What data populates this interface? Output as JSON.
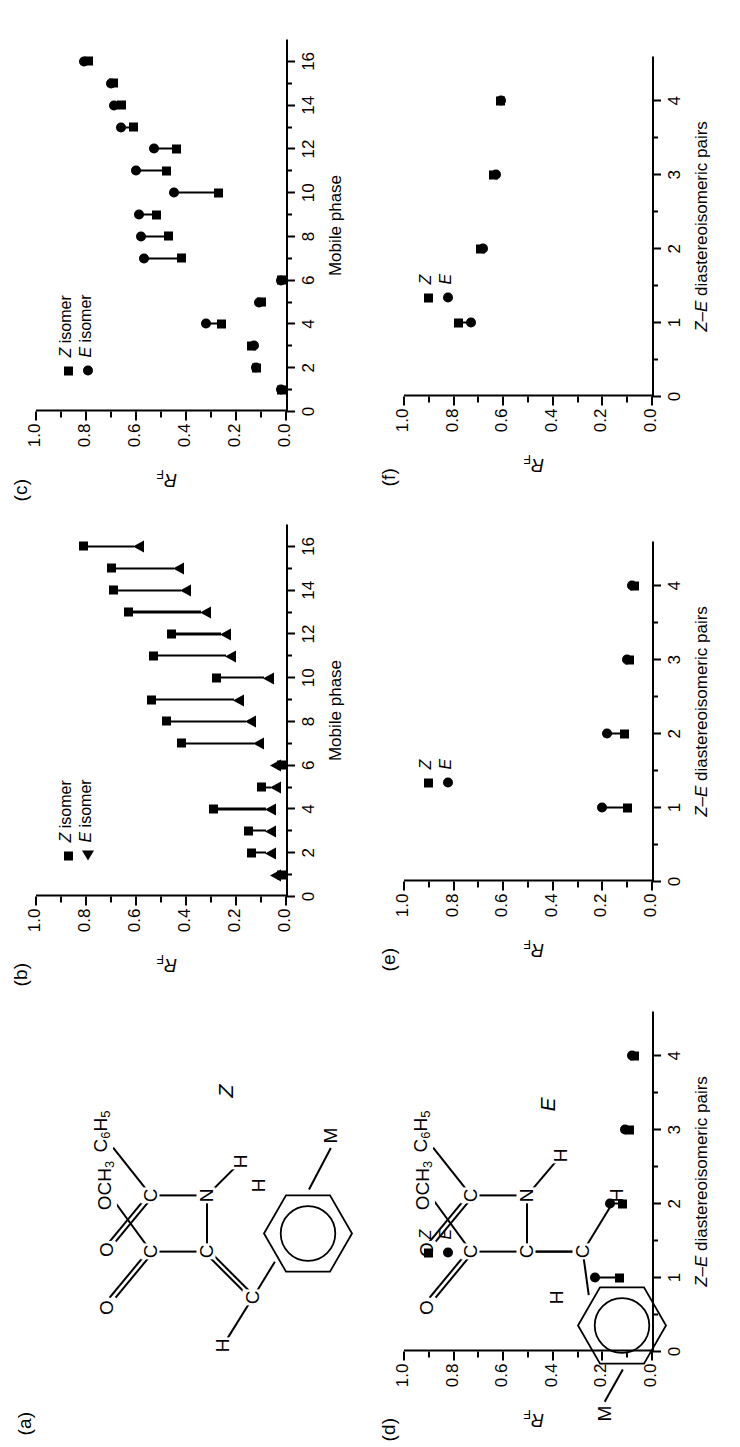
{
  "figure": {
    "panels": [
      "(a)",
      "(b)",
      "(c)",
      "(d)",
      "(e)",
      "(f)"
    ]
  },
  "panel_a": {
    "tag": "(a)",
    "z_label": "Z",
    "e_label": "E",
    "atoms": {
      "ocH3": "OCH3",
      "c6H5": "C6H5",
      "O": "O",
      "C": "C",
      "N": "N",
      "H": "H",
      "M": "M"
    }
  },
  "panel_b": {
    "tag": "(b)",
    "ylabel": "RF",
    "xlabel": "Mobile phase",
    "legend": [
      {
        "marker": "square",
        "label": "Z isomer"
      },
      {
        "marker": "triangle",
        "label": "E isomer"
      }
    ]
  },
  "panel_c": {
    "tag": "(c)",
    "ylabel": "RF",
    "xlabel": "Mobile phase",
    "legend": [
      {
        "marker": "square",
        "label": "Z isomer"
      },
      {
        "marker": "circle",
        "label": "E isomer"
      }
    ]
  },
  "panel_d": {
    "tag": "(d)",
    "ylabel": "RF",
    "xlabel": "Z–E diastereoisomeric pairs",
    "legend": [
      {
        "marker": "square",
        "label": "Z"
      },
      {
        "marker": "circle",
        "label": "E"
      }
    ]
  },
  "panel_e": {
    "tag": "(e)",
    "ylabel": "RF",
    "xlabel": "Z–E diastereoisomeric pairs",
    "legend": [
      {
        "marker": "square",
        "label": "Z"
      },
      {
        "marker": "circle",
        "label": "E"
      }
    ]
  },
  "panel_f": {
    "tag": "(f)",
    "ylabel": "RF",
    "xlabel": "Z–E diastereoisomeric pairs",
    "legend": [
      {
        "marker": "square",
        "label": "Z"
      },
      {
        "marker": "circle",
        "label": "E"
      }
    ]
  },
  "chart_data": [
    {
      "id": "b",
      "type": "scatter",
      "title": "(b)",
      "xlabel": "Mobile phase",
      "ylabel": "RF",
      "xlim": [
        0,
        17
      ],
      "ylim": [
        0.0,
        1.0
      ],
      "xticks": [
        0,
        2,
        4,
        6,
        8,
        10,
        12,
        14,
        16
      ],
      "xticklabels": [
        "0",
        "2",
        "4",
        "6",
        "8",
        "10",
        "12",
        "14",
        "16"
      ],
      "yticks": [
        0.0,
        0.2,
        0.4,
        0.6,
        0.8,
        1.0
      ],
      "yticklabels": [
        "0.0",
        "0.2",
        "0.4",
        "0.6",
        "0.8",
        "1.0"
      ],
      "grid": false,
      "legend_position": "upper-left",
      "series": [
        {
          "name": "Z isomer",
          "marker": "square",
          "x": [
            1,
            2,
            3,
            4,
            5,
            6,
            7,
            8,
            9,
            10,
            11,
            12,
            13,
            14,
            15,
            16
          ],
          "values": [
            0.02,
            0.14,
            0.15,
            0.29,
            0.1,
            0.02,
            0.42,
            0.48,
            0.54,
            0.28,
            0.53,
            0.46,
            0.63,
            0.69,
            0.7,
            0.81
          ]
        },
        {
          "name": "E isomer",
          "marker": "triangle",
          "x": [
            1,
            2,
            3,
            4,
            5,
            6,
            7,
            8,
            9,
            10,
            11,
            12,
            13,
            14,
            15,
            16
          ],
          "values": [
            0.02,
            0.04,
            0.04,
            0.04,
            0.02,
            0.02,
            0.09,
            0.12,
            0.17,
            0.05,
            0.2,
            0.22,
            0.3,
            0.38,
            0.41,
            0.57
          ]
        }
      ],
      "annotation": "arrows drawn from the Z (square) marker down to the E (triangle) marker"
    },
    {
      "id": "c",
      "type": "scatter",
      "title": "(c)",
      "xlabel": "Mobile phase",
      "ylabel": "RF",
      "xlim": [
        0,
        17
      ],
      "ylim": [
        0.0,
        1.0
      ],
      "xticks": [
        0,
        2,
        4,
        6,
        8,
        10,
        12,
        14,
        16
      ],
      "xticklabels": [
        "0",
        "2",
        "4",
        "6",
        "8",
        "10",
        "12",
        "14",
        "16"
      ],
      "yticks": [
        0.0,
        0.2,
        0.4,
        0.6,
        0.8,
        1.0
      ],
      "yticklabels": [
        "0.0",
        "0.2",
        "0.4",
        "0.6",
        "0.8",
        "1.0"
      ],
      "grid": false,
      "legend_position": "upper-left",
      "series": [
        {
          "name": "Z isomer",
          "marker": "square",
          "x": [
            1,
            2,
            3,
            4,
            5,
            6,
            7,
            8,
            9,
            10,
            11,
            12,
            13,
            14,
            15,
            16
          ],
          "values": [
            0.02,
            0.12,
            0.14,
            0.26,
            0.1,
            0.02,
            0.42,
            0.47,
            0.52,
            0.27,
            0.48,
            0.44,
            0.61,
            0.66,
            0.69,
            0.79
          ]
        },
        {
          "name": "E isomer",
          "marker": "circle",
          "x": [
            1,
            2,
            3,
            4,
            5,
            6,
            7,
            8,
            9,
            10,
            11,
            12,
            13,
            14,
            15,
            16
          ],
          "values": [
            0.02,
            0.12,
            0.13,
            0.32,
            0.11,
            0.02,
            0.57,
            0.58,
            0.59,
            0.45,
            0.6,
            0.53,
            0.66,
            0.69,
            0.7,
            0.81
          ]
        }
      ],
      "annotation": "line segments connect each Z–E pair"
    },
    {
      "id": "d",
      "type": "scatter",
      "title": "(d)",
      "xlabel": "Z–E diastereoisomeric pairs",
      "ylabel": "RF",
      "xlim": [
        0,
        4.6
      ],
      "ylim": [
        0.0,
        1.0
      ],
      "xticks": [
        0,
        1,
        2,
        3,
        4
      ],
      "xticklabels": [
        "0",
        "1",
        "2",
        "3",
        "4"
      ],
      "yticks": [
        0.0,
        0.2,
        0.4,
        0.6,
        0.8,
        1.0
      ],
      "yticklabels": [
        "0.0",
        "0.2",
        "0.4",
        "0.6",
        "0.8",
        "1.0"
      ],
      "grid": false,
      "legend_position": "upper-center",
      "categories": [
        1,
        2,
        3,
        4
      ],
      "series": [
        {
          "name": "Z",
          "marker": "square",
          "values": [
            0.13,
            0.12,
            0.09,
            0.07
          ]
        },
        {
          "name": "E",
          "marker": "circle",
          "values": [
            0.23,
            0.17,
            0.11,
            0.08
          ]
        }
      ]
    },
    {
      "id": "e",
      "type": "scatter",
      "title": "(e)",
      "xlabel": "Z–E diastereoisomeric pairs",
      "ylabel": "RF",
      "xlim": [
        0,
        4.6
      ],
      "ylim": [
        0.0,
        1.0
      ],
      "xticks": [
        0,
        1,
        2,
        3,
        4
      ],
      "xticklabels": [
        "0",
        "1",
        "2",
        "3",
        "4"
      ],
      "yticks": [
        0.0,
        0.2,
        0.4,
        0.6,
        0.8,
        1.0
      ],
      "yticklabels": [
        "0.0",
        "0.2",
        "0.4",
        "0.6",
        "0.8",
        "1.0"
      ],
      "grid": false,
      "legend_position": "upper-center",
      "categories": [
        1,
        2,
        3,
        4
      ],
      "series": [
        {
          "name": "Z",
          "marker": "square",
          "values": [
            0.1,
            0.11,
            0.09,
            0.07
          ]
        },
        {
          "name": "E",
          "marker": "circle",
          "values": [
            0.2,
            0.18,
            0.1,
            0.08
          ]
        }
      ]
    },
    {
      "id": "f",
      "type": "scatter",
      "title": "(f)",
      "xlabel": "Z–E diastereoisomeric pairs",
      "ylabel": "RF",
      "xlim": [
        0,
        4.6
      ],
      "ylim": [
        0.0,
        1.0
      ],
      "xticks": [
        0,
        1,
        2,
        3,
        4
      ],
      "xticklabels": [
        "0",
        "1",
        "2",
        "3",
        "4"
      ],
      "yticks": [
        0.0,
        0.2,
        0.4,
        0.6,
        0.8,
        1.0
      ],
      "yticklabels": [
        "0.0",
        "0.2",
        "0.4",
        "0.6",
        "0.8",
        "1.0"
      ],
      "grid": false,
      "legend_position": "upper-center",
      "categories": [
        1,
        2,
        3,
        4
      ],
      "series": [
        {
          "name": "Z",
          "marker": "square",
          "values": [
            0.78,
            0.69,
            0.64,
            0.61
          ]
        },
        {
          "name": "E",
          "marker": "circle",
          "values": [
            0.73,
            0.68,
            0.63,
            0.61
          ]
        }
      ]
    }
  ]
}
